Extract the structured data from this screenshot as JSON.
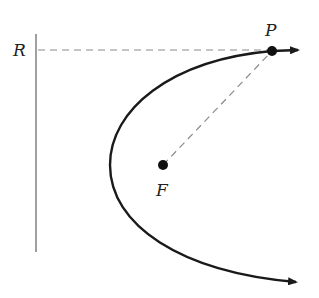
{
  "diagram": {
    "type": "parabola-focus-directrix",
    "labels": {
      "directrix": "R",
      "point": "P",
      "focus": "F"
    },
    "colors": {
      "curve": "#1a1a1a",
      "directrix": "#777777",
      "dashed": "#8a8a8a",
      "point": "#111111"
    }
  }
}
